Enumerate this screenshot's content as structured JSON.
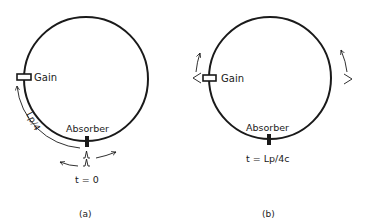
{
  "panels": [
    {
      "id": "a",
      "caption": "(a)",
      "gain_label": "Gain",
      "absorber_label": "Absorber",
      "distance_label": "Lp/4",
      "time_label": "t = 0"
    },
    {
      "id": "b",
      "caption": "(b)",
      "gain_label": "Gain",
      "absorber_label": "Absorber",
      "time_label": "t = Lp/4c"
    }
  ],
  "colors": {
    "stroke": "#1a1a1a",
    "background": "#ffffff"
  }
}
